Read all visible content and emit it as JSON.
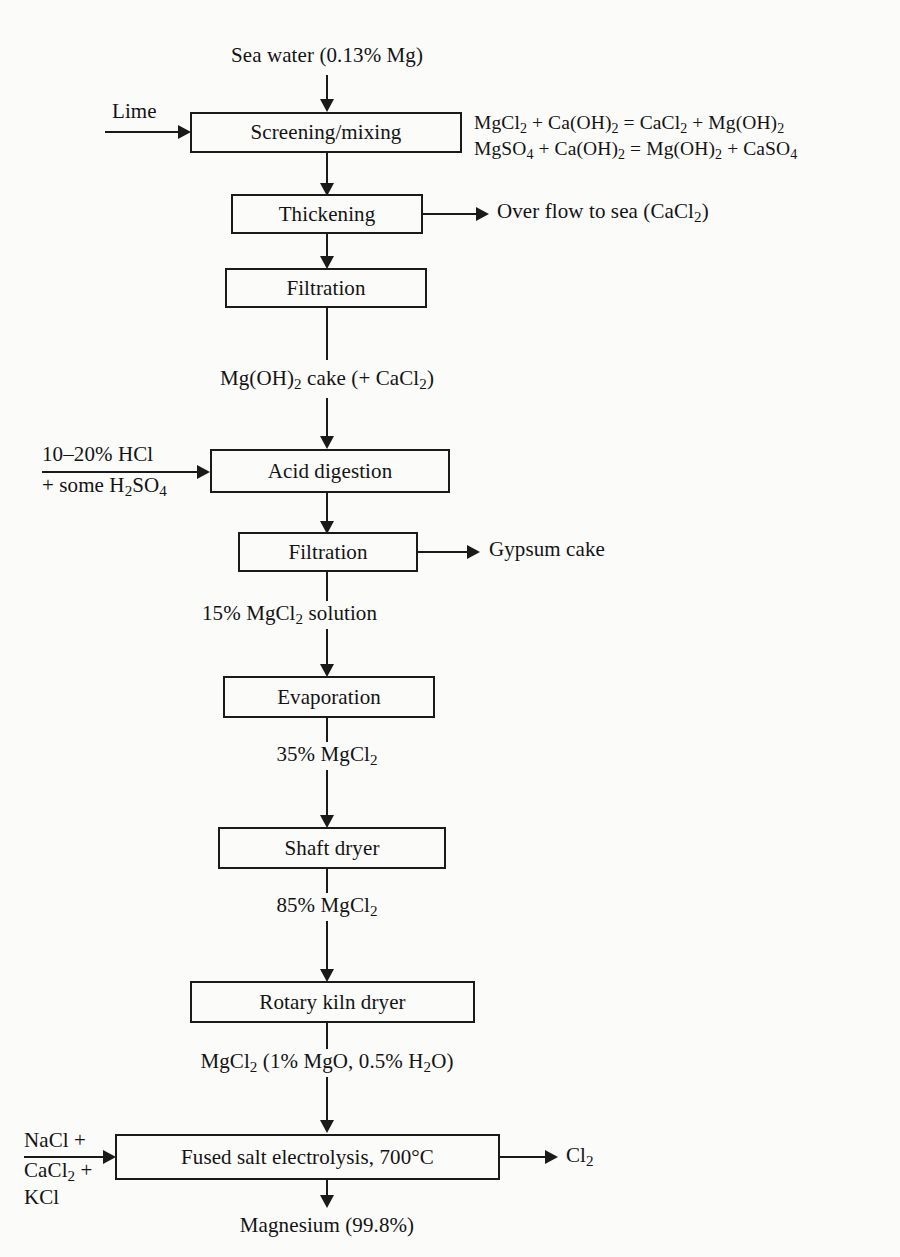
{
  "diagram": {
    "line_color": "#1a1a1a",
    "background": "#fbfbfa"
  },
  "boxes": {
    "screening": "Screening/mixing",
    "thickening": "Thickening",
    "filtration1": "Filtration",
    "acid_digestion": "Acid digestion",
    "filtration2": "Filtration",
    "evaporation": "Evaporation",
    "shaft_dryer": "Shaft dryer",
    "rotary_kiln": "Rotary kiln dryer",
    "electrolysis": "Fused salt electrolysis, 700°C"
  },
  "inputs": {
    "sea_water": "Sea water (0.13% Mg)",
    "lime": "Lime",
    "acid_line1": "10–20% HCl",
    "acid_line2": "+ some H2SO4",
    "salt_line1": "NaCl +",
    "salt_line2": "CaCl2 +",
    "salt_line3": "KCl"
  },
  "outputs": {
    "overflow": "Over flow to sea (CaCl2)",
    "gypsum": "Gypsum cake",
    "chlorine": "Cl2",
    "magnesium": "Magnesium (99.8%)"
  },
  "streams": {
    "mg_oh_cake": "Mg(OH)2 cake (+ CaCl2)",
    "mgcl2_15": "15% MgCl2 solution",
    "mgcl2_35": "35% MgCl2",
    "mgcl2_85": "85% MgCl2",
    "mgcl2_dry": "MgCl2 (1% MgO, 0.5% H2O)"
  },
  "equations": {
    "eq1": "MgCl2 + Ca(OH)2 = CaCl2 + Mg(OH)2",
    "eq2": "MgSO4 + Ca(OH)2 = Mg(OH)2 + CaSO4"
  }
}
